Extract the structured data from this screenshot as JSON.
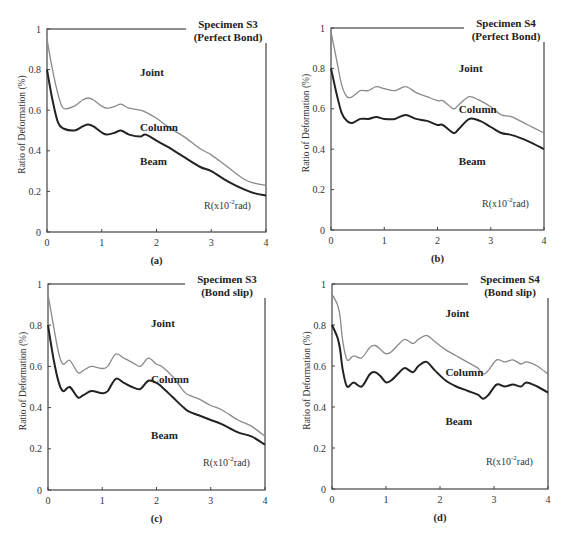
{
  "chart_data": [
    {
      "id": "a",
      "type": "line",
      "title": "Specimen S3",
      "subtitle": "(Perfect Bond)",
      "caption": "(a)",
      "xlabel": "R(x10-2rad)",
      "ylabel": "Ratio of Deformation (%)",
      "xlim": [
        0,
        4
      ],
      "ylim": [
        0,
        1
      ],
      "xticks": [
        "0",
        "1",
        "2",
        "3",
        "4"
      ],
      "yticks": [
        "0",
        "0.2",
        "0.4",
        "0.6",
        "0.8",
        "1"
      ],
      "region_labels": [
        {
          "text": "Joint",
          "x": 1.7,
          "y": 0.77
        },
        {
          "text": "Column",
          "x": 1.7,
          "y": 0.5
        },
        {
          "text": "Beam",
          "x": 1.7,
          "y": 0.33
        }
      ],
      "series": [
        {
          "name": "Joint/Column boundary",
          "color": "#8a8a8a",
          "x": [
            0,
            0.1,
            0.2,
            0.3,
            0.5,
            0.65,
            0.75,
            0.85,
            1.0,
            1.1,
            1.25,
            1.35,
            1.5,
            1.7,
            1.8,
            2.0,
            2.2,
            2.5,
            2.8,
            3.0,
            3.3,
            3.6,
            3.8,
            4.0
          ],
          "y": [
            0.95,
            0.8,
            0.68,
            0.61,
            0.62,
            0.65,
            0.66,
            0.65,
            0.62,
            0.61,
            0.62,
            0.63,
            0.61,
            0.6,
            0.59,
            0.56,
            0.52,
            0.47,
            0.41,
            0.38,
            0.32,
            0.26,
            0.24,
            0.23
          ]
        },
        {
          "name": "Column/Beam boundary",
          "color": "#222222",
          "x": [
            0,
            0.1,
            0.2,
            0.3,
            0.5,
            0.65,
            0.75,
            0.85,
            1.0,
            1.1,
            1.25,
            1.35,
            1.5,
            1.7,
            1.8,
            2.0,
            2.2,
            2.5,
            2.8,
            3.0,
            3.3,
            3.6,
            3.8,
            4.0
          ],
          "y": [
            0.8,
            0.65,
            0.54,
            0.51,
            0.5,
            0.52,
            0.53,
            0.52,
            0.49,
            0.48,
            0.49,
            0.5,
            0.48,
            0.47,
            0.48,
            0.45,
            0.42,
            0.37,
            0.32,
            0.3,
            0.25,
            0.21,
            0.19,
            0.18
          ]
        }
      ]
    },
    {
      "id": "b",
      "type": "line",
      "title": "Specimen S4",
      "subtitle": "(Perfect Bond)",
      "caption": "(b)",
      "xlabel": "R(x10-2rad)",
      "ylabel": "Ratio of Deformation (%)",
      "xlim": [
        0,
        4
      ],
      "ylim": [
        0,
        1
      ],
      "xticks": [
        "0",
        "1",
        "2",
        "3",
        "4"
      ],
      "yticks": [
        "0",
        "0.2",
        "0.4",
        "0.6",
        "0.8",
        "1"
      ],
      "region_labels": [
        {
          "text": "Joint",
          "x": 2.4,
          "y": 0.78
        },
        {
          "text": "Column",
          "x": 2.4,
          "y": 0.58
        },
        {
          "text": "Beam",
          "x": 2.4,
          "y": 0.32
        }
      ],
      "series": [
        {
          "name": "Joint/Column boundary",
          "color": "#8a8a8a",
          "x": [
            0,
            0.1,
            0.2,
            0.3,
            0.4,
            0.55,
            0.7,
            0.85,
            1.0,
            1.2,
            1.4,
            1.6,
            1.8,
            2.0,
            2.1,
            2.3,
            2.4,
            2.6,
            2.8,
            3.0,
            3.2,
            3.4,
            3.7,
            4.0
          ],
          "y": [
            0.98,
            0.85,
            0.72,
            0.66,
            0.66,
            0.69,
            0.69,
            0.71,
            0.7,
            0.69,
            0.71,
            0.68,
            0.66,
            0.64,
            0.64,
            0.6,
            0.62,
            0.66,
            0.64,
            0.61,
            0.57,
            0.56,
            0.52,
            0.48
          ]
        },
        {
          "name": "Column/Beam boundary",
          "color": "#222222",
          "x": [
            0,
            0.1,
            0.2,
            0.3,
            0.4,
            0.55,
            0.7,
            0.85,
            1.0,
            1.2,
            1.4,
            1.6,
            1.8,
            2.0,
            2.1,
            2.3,
            2.4,
            2.6,
            2.8,
            3.0,
            3.2,
            3.4,
            3.7,
            4.0
          ],
          "y": [
            0.8,
            0.68,
            0.58,
            0.54,
            0.53,
            0.55,
            0.55,
            0.56,
            0.55,
            0.55,
            0.57,
            0.55,
            0.54,
            0.52,
            0.52,
            0.48,
            0.5,
            0.55,
            0.54,
            0.51,
            0.48,
            0.47,
            0.44,
            0.4
          ]
        }
      ]
    },
    {
      "id": "c",
      "type": "line",
      "title": "Specimen S3",
      "subtitle": "(Bond slip)",
      "caption": "(c)",
      "xlabel": "R(x10-2rad)",
      "ylabel": "Ratio of Deformation (%)",
      "xlim": [
        0,
        4
      ],
      "ylim": [
        0,
        1
      ],
      "xticks": [
        "0",
        "1",
        "2",
        "3",
        "4"
      ],
      "yticks": [
        "0",
        "0.2",
        "0.4",
        "0.6",
        "0.8",
        "1"
      ],
      "region_labels": [
        {
          "text": "Joint",
          "x": 1.9,
          "y": 0.79
        },
        {
          "text": "Column",
          "x": 1.9,
          "y": 0.52
        },
        {
          "text": "Beam",
          "x": 1.9,
          "y": 0.25
        }
      ],
      "series": [
        {
          "name": "Joint/Column boundary",
          "color": "#8a8a8a",
          "x": [
            0,
            0.1,
            0.2,
            0.28,
            0.4,
            0.55,
            0.65,
            0.8,
            1.0,
            1.1,
            1.25,
            1.4,
            1.55,
            1.7,
            1.85,
            2.0,
            2.1,
            2.3,
            2.5,
            2.6,
            2.8,
            3.0,
            3.2,
            3.5,
            3.75,
            4.0
          ],
          "y": [
            0.95,
            0.8,
            0.66,
            0.61,
            0.63,
            0.57,
            0.58,
            0.6,
            0.59,
            0.6,
            0.66,
            0.64,
            0.62,
            0.6,
            0.64,
            0.61,
            0.6,
            0.55,
            0.48,
            0.46,
            0.44,
            0.41,
            0.39,
            0.34,
            0.31,
            0.26
          ]
        },
        {
          "name": "Column/Beam boundary",
          "color": "#222222",
          "x": [
            0,
            0.1,
            0.2,
            0.28,
            0.4,
            0.55,
            0.65,
            0.8,
            1.0,
            1.1,
            1.25,
            1.4,
            1.55,
            1.7,
            1.85,
            2.0,
            2.1,
            2.3,
            2.5,
            2.6,
            2.8,
            3.0,
            3.2,
            3.5,
            3.75,
            4.0
          ],
          "y": [
            0.8,
            0.64,
            0.52,
            0.48,
            0.5,
            0.45,
            0.46,
            0.48,
            0.47,
            0.48,
            0.54,
            0.52,
            0.5,
            0.49,
            0.53,
            0.52,
            0.5,
            0.45,
            0.4,
            0.38,
            0.36,
            0.34,
            0.32,
            0.28,
            0.26,
            0.22
          ]
        }
      ]
    },
    {
      "id": "d",
      "type": "line",
      "title": "Specimen S4",
      "subtitle": "(Bond slip)",
      "caption": "(d)",
      "xlabel": "R(x10-2rad)",
      "ylabel": "Ratio of Deformation (%)",
      "xlim": [
        0,
        4
      ],
      "ylim": [
        0,
        1
      ],
      "xticks": [
        "0",
        "1",
        "2",
        "3",
        "4"
      ],
      "yticks": [
        "0",
        "0.2",
        "0.4",
        "0.6",
        "0.8",
        "1"
      ],
      "region_labels": [
        {
          "text": "Joint",
          "x": 2.1,
          "y": 0.84
        },
        {
          "text": "Column",
          "x": 2.1,
          "y": 0.55
        },
        {
          "text": "Beam",
          "x": 2.1,
          "y": 0.31
        }
      ],
      "series": [
        {
          "name": "Joint/Column boundary",
          "color": "#8a8a8a",
          "x": [
            0,
            0.1,
            0.15,
            0.2,
            0.28,
            0.4,
            0.55,
            0.7,
            0.8,
            0.9,
            1.0,
            1.1,
            1.25,
            1.35,
            1.5,
            1.6,
            1.75,
            1.9,
            2.1,
            2.3,
            2.5,
            2.7,
            2.8,
            2.9,
            3.05,
            3.2,
            3.35,
            3.5,
            3.6,
            3.8,
            4.0
          ],
          "y": [
            0.95,
            0.9,
            0.84,
            0.72,
            0.63,
            0.65,
            0.64,
            0.69,
            0.7,
            0.68,
            0.66,
            0.67,
            0.71,
            0.73,
            0.71,
            0.73,
            0.75,
            0.72,
            0.68,
            0.65,
            0.62,
            0.59,
            0.56,
            0.58,
            0.63,
            0.62,
            0.63,
            0.61,
            0.62,
            0.6,
            0.56
          ]
        },
        {
          "name": "Column/Beam boundary",
          "color": "#222222",
          "x": [
            0,
            0.1,
            0.15,
            0.2,
            0.28,
            0.4,
            0.55,
            0.7,
            0.8,
            0.9,
            1.0,
            1.1,
            1.25,
            1.35,
            1.5,
            1.6,
            1.75,
            1.9,
            2.1,
            2.3,
            2.5,
            2.7,
            2.8,
            2.9,
            3.05,
            3.2,
            3.35,
            3.5,
            3.6,
            3.8,
            4.0
          ],
          "y": [
            0.8,
            0.74,
            0.68,
            0.58,
            0.5,
            0.52,
            0.5,
            0.56,
            0.57,
            0.55,
            0.52,
            0.53,
            0.57,
            0.59,
            0.57,
            0.6,
            0.62,
            0.58,
            0.53,
            0.5,
            0.48,
            0.46,
            0.44,
            0.46,
            0.51,
            0.5,
            0.51,
            0.5,
            0.52,
            0.5,
            0.47
          ]
        }
      ]
    }
  ],
  "panels": [
    {
      "title": "Specimen S3",
      "subtitle": "(Perfect Bond)",
      "caption": "(a)",
      "xunit_main": "R(x10",
      "xunit_sup": "-2",
      "xunit_end": "rad)",
      "ylabel": "Ratio of Deformation (%)",
      "labels": [
        "Joint",
        "Column",
        "Beam"
      ]
    },
    {
      "title": "Specimen S4",
      "subtitle": "(Perfect Bond)",
      "caption": "(b)",
      "xunit_main": "R(x10",
      "xunit_sup": "-2",
      "xunit_end": "rad)",
      "ylabel": "Ratio of Deformation (%)",
      "labels": [
        "Joint",
        "Column",
        "Beam"
      ]
    },
    {
      "title": "Specimen S3",
      "subtitle": "(Bond slip)",
      "caption": "(c)",
      "xunit_main": "R(x10",
      "xunit_sup": "-2",
      "xunit_end": "rad)",
      "ylabel": "Ratio of Deformation (%)",
      "labels": [
        "Joint",
        "Column",
        "Beam"
      ]
    },
    {
      "title": "Specimen S4",
      "subtitle": "(Bond slip)",
      "caption": "(d)",
      "xunit_main": "R(x10",
      "xunit_sup": "-2",
      "xunit_end": "rad)",
      "ylabel": "Ratio of Deformation (%)",
      "labels": [
        "Joint",
        "Column",
        "Beam"
      ]
    }
  ]
}
